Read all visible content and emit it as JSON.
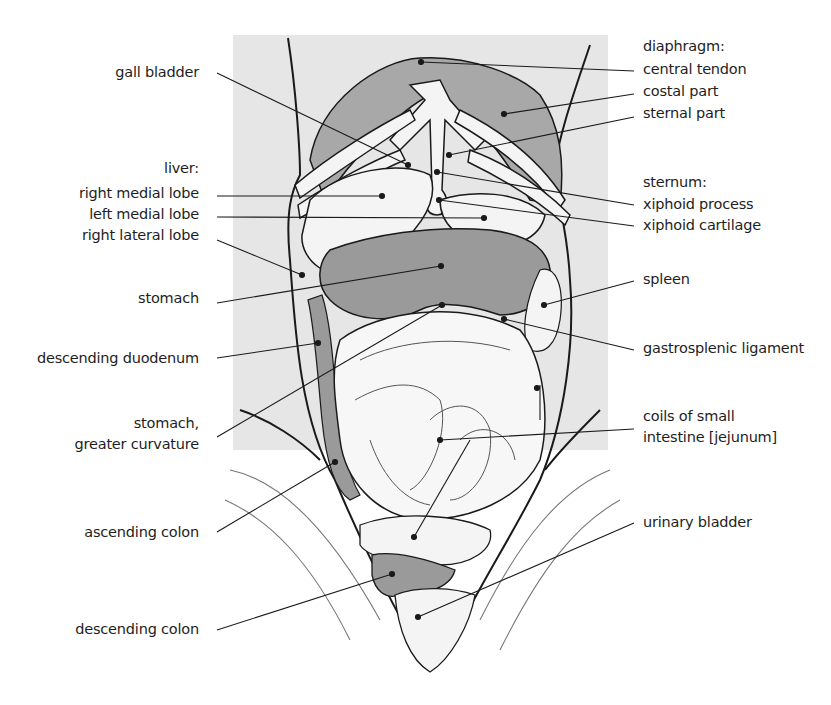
{
  "colors": {
    "background": "#ffffff",
    "panel": "#e6e6e6",
    "organ_dark": "#9a9a9a",
    "organ_mid": "#b5b5b5",
    "organ_light": "#f4f4f4",
    "line": "#1a1a1a"
  },
  "labels_left": {
    "gall_bladder": "gall bladder",
    "liver_heading": "liver:",
    "right_medial_lobe": "right medial lobe",
    "left_medial_lobe": "left medial lobe",
    "right_lateral_lobe": "right lateral lobe",
    "stomach": "stomach",
    "descending_duodenum": "descending duodenum",
    "stomach_greater_curvature_1": "stomach,",
    "stomach_greater_curvature_2": "greater curvature",
    "ascending_colon": "ascending colon",
    "descending_colon": "descending colon"
  },
  "labels_right": {
    "diaphragm_heading": "diaphragm:",
    "central_tendon": "central tendon",
    "costal_part": "costal part",
    "sternal_part": "sternal part",
    "sternum_heading": "sternum:",
    "xiphoid_process": "xiphoid process",
    "xiphoid_cartilage": "xiphoid cartilage",
    "spleen": "spleen",
    "gastrosplenic_ligament": "gastrosplenic ligament",
    "coils_small_intestine_1": "coils of small",
    "coils_small_intestine_2": "intestine [jejunum]",
    "urinary_bladder": "urinary bladder"
  }
}
